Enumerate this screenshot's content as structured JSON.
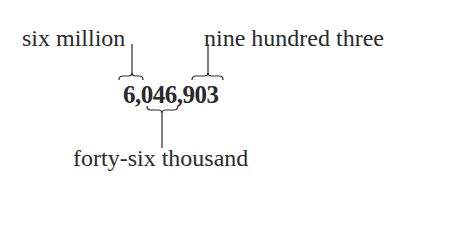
{
  "diagram": {
    "number": "6,046,903",
    "labels": {
      "millions": "six million",
      "thousands": "forty-six thousand",
      "ones": "nine hundred three"
    },
    "groups": [
      {
        "digits": "6",
        "period": "millions",
        "words": "six million",
        "brace": "above"
      },
      {
        "digits": "046",
        "period": "thousands",
        "words": "forty-six thousand",
        "brace": "below"
      },
      {
        "digits": "903",
        "period": "ones",
        "words": "nine hundred three",
        "brace": "above"
      }
    ],
    "ink_color": "#2a2a2a"
  }
}
